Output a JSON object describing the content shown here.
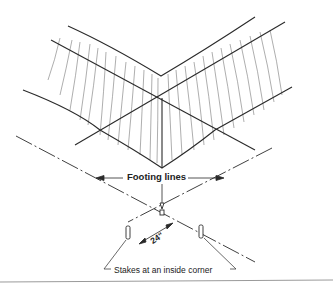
{
  "diagram": {
    "labels": {
      "footing_lines": "Footing lines",
      "stakes": "Stakes at an inside corner",
      "dimension": "24\""
    },
    "colors": {
      "line": "#2a2a2a",
      "hatch": "#666666",
      "rule": "#9a9a9a"
    }
  }
}
